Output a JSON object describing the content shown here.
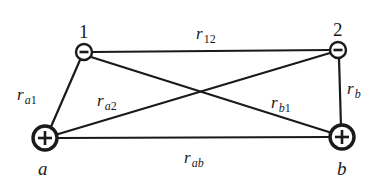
{
  "diagram": {
    "nodes": [
      {
        "id": "1",
        "label": "1",
        "charge": "negative",
        "sign": "−",
        "x": 84,
        "y": 52
      },
      {
        "id": "2",
        "label": "2",
        "charge": "negative",
        "sign": "−",
        "x": 338,
        "y": 50
      },
      {
        "id": "a",
        "label": "a",
        "charge": "positive",
        "sign": "+",
        "x": 45,
        "y": 138
      },
      {
        "id": "b",
        "label": "b",
        "charge": "positive",
        "sign": "+",
        "x": 342,
        "y": 137
      }
    ],
    "edges": [
      {
        "from": "1",
        "to": "2",
        "label": "r",
        "subscript": "12"
      },
      {
        "from": "a",
        "to": "1",
        "label": "r",
        "subscript": "a1"
      },
      {
        "from": "a",
        "to": "2",
        "label": "r",
        "subscript": "a2"
      },
      {
        "from": "b",
        "to": "1",
        "label": "r",
        "subscript": "b1"
      },
      {
        "from": "b",
        "to": "2",
        "label": "r",
        "subscript": "b"
      },
      {
        "from": "a",
        "to": "b",
        "label": "r",
        "subscript": "ab"
      }
    ]
  },
  "labels": {
    "node_1": "1",
    "node_2": "2",
    "node_a": "a",
    "node_b": "b",
    "r": "r",
    "sub_12": "12",
    "sub_a1_letter": "a",
    "sub_a1_num": "1",
    "sub_a2_letter": "a",
    "sub_a2_num": "2",
    "sub_b1_letter": "b",
    "sub_b1_num": "1",
    "sub_b": "b",
    "sub_ab": "ab"
  },
  "colors": {
    "ink": "#1a1a1a",
    "background": "#ffffff"
  }
}
